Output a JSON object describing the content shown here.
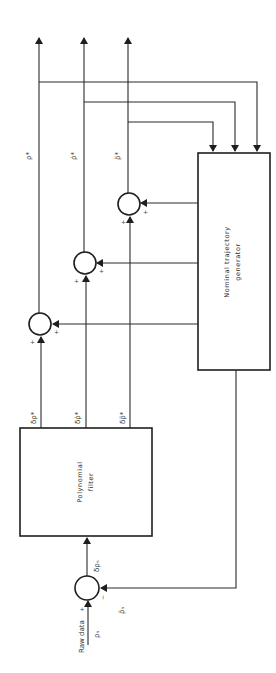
{
  "figure": {
    "orientation": "rotated-90-ccw",
    "blocks": {
      "polynomial_filter": {
        "line1": "Polynomial",
        "line2": "filter"
      },
      "nominal_trajectory_generator": {
        "line1": "Nominal trajectory",
        "line2": "generator"
      }
    },
    "input": {
      "label": "Raw data",
      "signal": "ρₙ",
      "sign": "+"
    },
    "input_sum": {
      "error_signal": "δρₙ",
      "feedback_signal": "ρ̄ₙ",
      "feedback_sign": "−"
    },
    "filter_outputs": [
      "δρ*",
      "δρ̇*",
      "δρ̈*"
    ],
    "outputs": [
      "ρ*",
      "ρ̇*",
      "ρ̈*"
    ],
    "sum_signs": {
      "bottom": "+",
      "right": "+"
    }
  }
}
